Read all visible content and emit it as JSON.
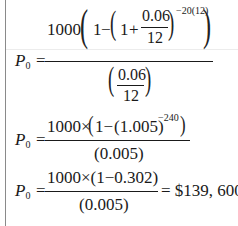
{
  "document": {
    "lhs": {
      "symbol": "P",
      "subscript": "0",
      "equals": "="
    },
    "eq1": {
      "coef": "1000",
      "one": "1",
      "minus": "−",
      "inner_one": "1",
      "plus": "+",
      "rate_num": "0.06",
      "rate_den": "12",
      "exponent": "−20(12)",
      "den_num": "0.06",
      "den_den": "12"
    },
    "eq2": {
      "numerator_a": "1000×",
      "numerator_b": "1−",
      "numerator_c": "(1.005)",
      "exponent": "−240",
      "denominator": "(0.005)"
    },
    "eq3": {
      "numerator": "1000×(1−0.302)",
      "denominator": "(0.005)",
      "result": "= $139, 600"
    }
  }
}
